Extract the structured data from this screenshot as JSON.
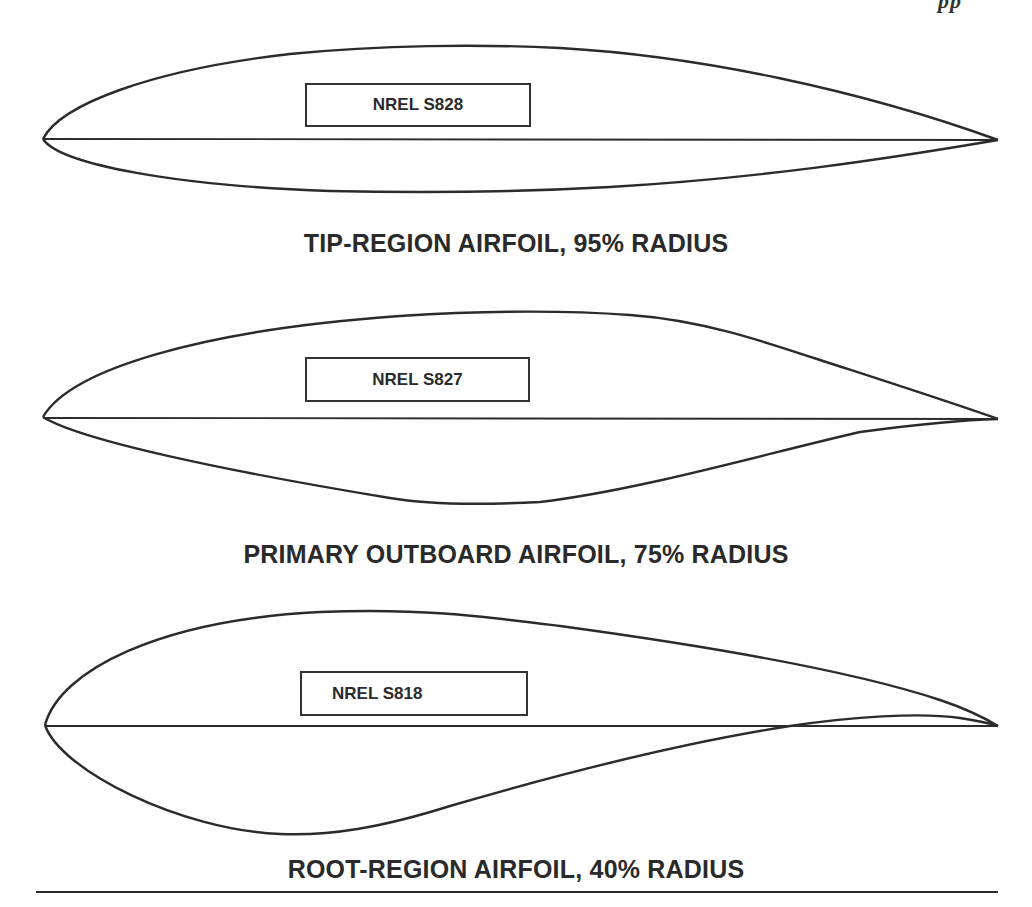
{
  "page": {
    "header_fragment": "pp"
  },
  "airfoils": [
    {
      "id": "s828",
      "designation": "NREL S828",
      "caption": "TIP-REGION AIRFOIL, 95% RADIUS",
      "radius_percent": 95
    },
    {
      "id": "s827",
      "designation": "NREL S827",
      "caption": "PRIMARY OUTBOARD AIRFOIL, 75% RADIUS",
      "radius_percent": 75
    },
    {
      "id": "s818",
      "designation": "NREL S818",
      "caption": "ROOT-REGION AIRFOIL, 40% RADIUS",
      "radius_percent": 40
    }
  ],
  "colors": {
    "stroke": "#2b2b2b",
    "text": "#2a2a2a",
    "background": "#ffffff"
  }
}
